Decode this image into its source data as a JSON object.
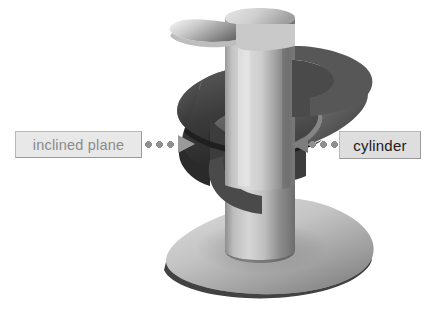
{
  "figure": {
    "background_color": "#ffffff",
    "parts": [
      {
        "id": "inclined-plane",
        "name": "inclined plane",
        "description": "helical blade winding around the shaft"
      },
      {
        "id": "cylinder",
        "name": "cylinder",
        "description": "vertical central shaft"
      }
    ]
  },
  "callouts": [
    {
      "id": "inclined-plane",
      "label": "inclined plane",
      "side": "left",
      "text_color": "#8b8b8b",
      "box_color": "#e8e8e8",
      "border_color": "#9a9a9a",
      "arrow_direction": "right"
    },
    {
      "id": "cylinder",
      "label": "cylinder",
      "side": "right",
      "text_color": "#1a1a1a",
      "box_color": "#dedede",
      "border_color": "#9a9a9a",
      "arrow_direction": "left"
    }
  ],
  "colors": {
    "leader_dot": "#8f8f8f",
    "arrow_left": "#9a9a9a",
    "arrow_right": "#7d7d7d",
    "shaft_light": "#d8d8d8",
    "shaft_mid": "#a8a8a8",
    "shaft_dark": "#6f6f6f",
    "blade_top": "#cfcfcf",
    "blade_under": "#4a4a4a",
    "blade_edge": "#2b2b2b"
  }
}
